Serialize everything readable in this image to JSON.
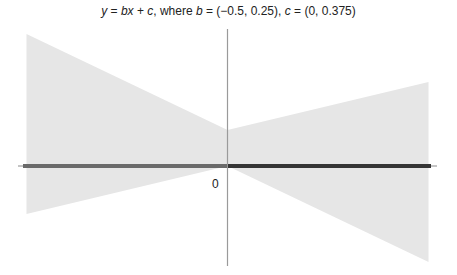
{
  "chart_data": {
    "type": "area",
    "title": "y = bx + c, where b = (−0.5, 0.25), c = (0, 0.375)",
    "title_parts": {
      "y": "y",
      "eq1": " = ",
      "b": "b",
      "x": "x",
      "plus": " + ",
      "c": "c",
      "where": ", where ",
      "b2": "b",
      "b_range": " = (−0.5, 0.25), ",
      "c2": "c",
      "c_range": " = (0, 0.375)"
    },
    "xlabel": "",
    "ylabel": "",
    "tick_labels": [
      "0"
    ],
    "xlim": [
      -2.1,
      2.1
    ],
    "ylim": [
      -1.05,
      1.4
    ],
    "grid": false,
    "legend": null,
    "b_range": [
      -0.5,
      0.25
    ],
    "c_range": [
      0,
      0.375
    ],
    "regions": [
      {
        "name": "left-band",
        "x": [
          -2,
          0
        ],
        "upper": [
          1.375,
          0.375
        ],
        "lower": [
          -0.5,
          0
        ],
        "fill": "#e6e6e6"
      },
      {
        "name": "right-band",
        "x": [
          0,
          2
        ],
        "upper": [
          0.375,
          0.875
        ],
        "lower": [
          0,
          -1.0
        ],
        "fill": "#e6e6e6"
      }
    ],
    "series": [
      {
        "name": "x-axis-segment-negative",
        "x": [
          -2,
          0
        ],
        "y": [
          0,
          0
        ],
        "color": "#6a6a6a",
        "width": 4
      },
      {
        "name": "x-axis-segment-positive",
        "x": [
          0,
          2
        ],
        "y": [
          0,
          0
        ],
        "color": "#353535",
        "width": 4
      }
    ]
  },
  "labels": {
    "origin": "0"
  }
}
